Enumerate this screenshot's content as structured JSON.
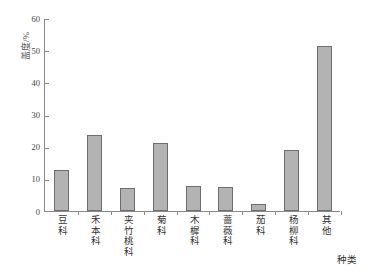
{
  "chart_data": {
    "type": "bar",
    "title": "",
    "xlabel": "种类",
    "ylabel": "盖度/%",
    "ylim": [
      0,
      60
    ],
    "ytick_step": 10,
    "yticks": [
      60,
      50,
      40,
      30,
      20,
      10,
      0
    ],
    "grid": false,
    "legend": null,
    "bar_color": "#b3b3b3",
    "bar_border_color": "#6e6e6e",
    "axis_color": "#8a8a8a",
    "categories": [
      "豆科",
      "禾本科",
      "夹竹桃科",
      "菊科",
      "木樨科",
      "蔷薇科",
      "茄科",
      "杨柳科",
      "其他"
    ],
    "values": [
      12.9,
      23.6,
      7.2,
      21.2,
      7.8,
      7.6,
      2.3,
      18.9,
      51.2
    ]
  }
}
